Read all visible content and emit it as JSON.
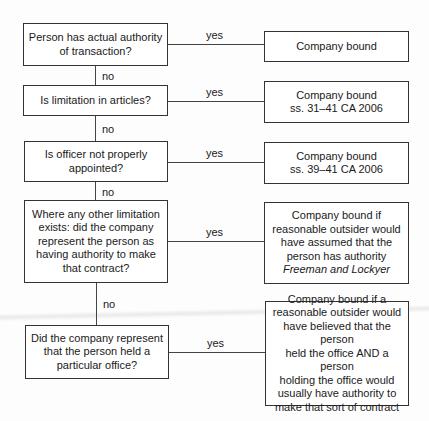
{
  "flowchart": {
    "questions": [
      {
        "lines": [
          "Person has actual authority",
          "of transaction?"
        ]
      },
      {
        "lines": [
          "Is limitation in articles?"
        ]
      },
      {
        "lines": [
          "Is officer not properly",
          "appointed?"
        ]
      },
      {
        "lines": [
          "Where any other limitation",
          "exists: did the company",
          "represent the person as",
          "having authority to make",
          "that contract?"
        ]
      },
      {
        "lines": [
          "Did the company represent",
          "that the person held a",
          "particular office?"
        ]
      }
    ],
    "outcomes": [
      {
        "lines": [
          "Company bound"
        ]
      },
      {
        "lines": [
          "Company bound",
          "ss. 31–41 CA 2006"
        ]
      },
      {
        "lines": [
          "Company bound",
          "ss. 39–41 CA 2006"
        ]
      },
      {
        "lines": [
          "Company bound if",
          "reasonable outsider would",
          "have assumed that the",
          "person has authority"
        ],
        "case": "Freeman and Lockyer"
      },
      {
        "lines": [
          "Company bound if a",
          "reasonable outsider would",
          "have believed that the person",
          "held the office AND a person",
          "holding the office would",
          "usually have authority to",
          "make that sort of contract"
        ]
      }
    ],
    "yes_label": "yes",
    "no_label": "no"
  }
}
